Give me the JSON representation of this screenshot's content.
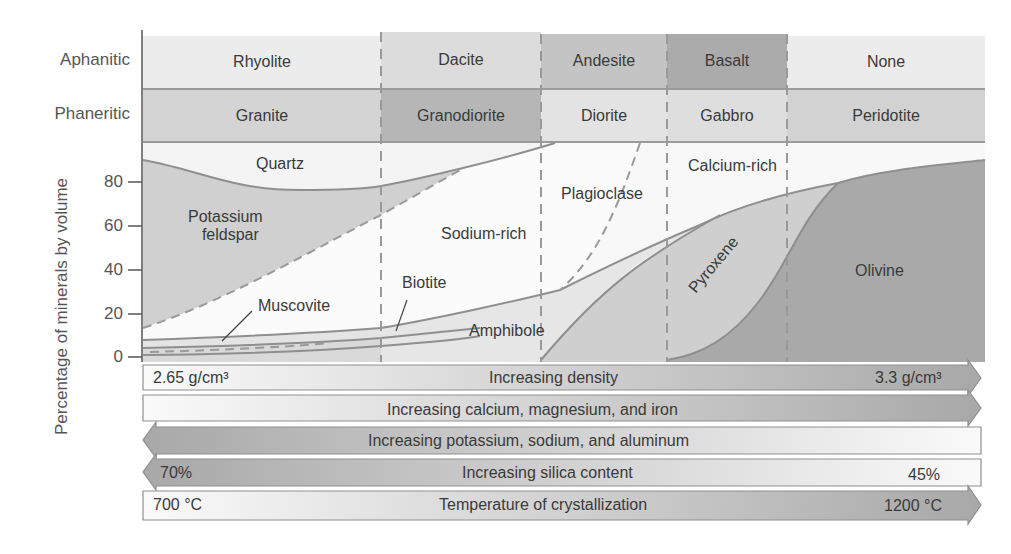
{
  "row_labels": {
    "aphanitic": "Aphanitic",
    "phaneritic": "Phaneritic"
  },
  "aphanitic_rocks": [
    "Rhyolite",
    "Dacite",
    "Andesite",
    "Basalt",
    "None"
  ],
  "phaneritic_rocks": [
    "Granite",
    "Granodiorite",
    "Diorite",
    "Gabbro",
    "Peridotite"
  ],
  "y_axis": {
    "label": "Percentage of minerals by volume",
    "ticks": [
      "80",
      "60",
      "40",
      "20",
      "0"
    ]
  },
  "minerals": {
    "quartz": "Quartz",
    "potassium_feldspar_line1": "Potassium",
    "potassium_feldspar_line2": "feldspar",
    "muscovite": "Muscovite",
    "biotite": "Biotite",
    "sodium_rich": "Sodium-rich",
    "plagioclase": "Plagioclase",
    "calcium_rich": "Calcium-rich",
    "amphibole": "Amphibole",
    "pyroxene": "Pyroxene",
    "olivine": "Olivine"
  },
  "trend_bars": [
    {
      "left": "2.65 g/cm³",
      "center": "Increasing density",
      "right": "3.3 g/cm³",
      "direction": "right"
    },
    {
      "left": "",
      "center": "Increasing calcium, magnesium, and iron",
      "right": "",
      "direction": "right"
    },
    {
      "left": "",
      "center": "Increasing potassium, sodium, and aluminum",
      "right": "",
      "direction": "left"
    },
    {
      "left": "70%",
      "center": "Increasing silica content",
      "right": "45%",
      "direction": "left"
    },
    {
      "left": "700 °C",
      "center": "Temperature of crystallization",
      "right": "1200 °C",
      "direction": "right"
    }
  ],
  "colors": {
    "light": "#f1f1f1",
    "mid": "#d6d6d6",
    "dark": "#bdbdbd",
    "darker": "#a9a9a9",
    "line": "#8f8f8f"
  }
}
